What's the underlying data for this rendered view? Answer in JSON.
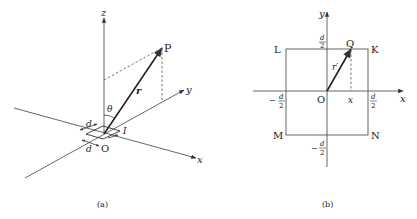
{
  "panel_a": {
    "caption": "(a)",
    "axes": {
      "x": "x",
      "y": "y",
      "z": "z"
    },
    "origin": "O",
    "point": "P",
    "vector": "r",
    "angle": "θ",
    "loop_side_1": "d",
    "loop_side_2": "d",
    "current": "I"
  },
  "panel_b": {
    "caption": "(b)",
    "axes": {
      "x": "x",
      "y": "y"
    },
    "origin": "O",
    "corners": {
      "top_left": "L",
      "top_right": "K",
      "bottom_left": "M",
      "bottom_right": "N"
    },
    "point": "Q",
    "vector": "r′",
    "x_marker": "x",
    "ticks": {
      "d_num": "d",
      "d_den": "2",
      "neg": "−"
    }
  }
}
